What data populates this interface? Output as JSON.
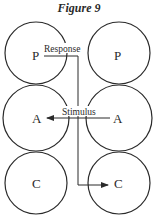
{
  "figure": {
    "title": "Figure 9",
    "stroke_color": "#2a2a2a",
    "background": "#ffffff"
  },
  "columns": [
    {
      "side": "left",
      "states": [
        {
          "label": "P",
          "row": "top"
        },
        {
          "label": "A",
          "row": "middle"
        },
        {
          "label": "C",
          "row": "bottom"
        }
      ]
    },
    {
      "side": "right",
      "states": [
        {
          "label": "P",
          "row": "top"
        },
        {
          "label": "A",
          "row": "middle"
        },
        {
          "label": "C",
          "row": "bottom"
        }
      ]
    }
  ],
  "arrows": [
    {
      "label": "Response",
      "from": "left P",
      "to": "right C",
      "path": "horizontal then down then right"
    },
    {
      "label": "Stimulus",
      "from": "right A",
      "to": "left A",
      "path": "horizontal leftward"
    }
  ]
}
